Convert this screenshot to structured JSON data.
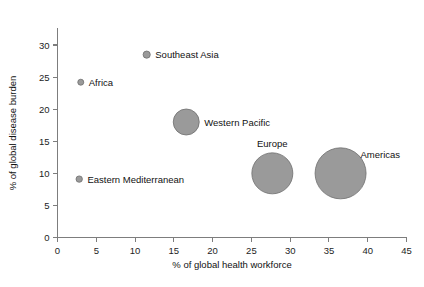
{
  "chart_data": {
    "type": "scatter",
    "title": "",
    "xlabel": "% of global health workforce",
    "ylabel": "% of global disease burden",
    "xlim": [
      0,
      45
    ],
    "ylim": [
      0,
      33
    ],
    "xticks": [
      0,
      5,
      10,
      15,
      20,
      25,
      30,
      35,
      40,
      45
    ],
    "yticks": [
      0,
      5,
      10,
      15,
      20,
      25,
      30
    ],
    "xtick_labels": [
      "0",
      "5",
      "10",
      "15",
      "20",
      "25",
      "30",
      "35",
      "40",
      "45"
    ],
    "ytick_labels": [
      "0",
      "5",
      "10",
      "15",
      "20",
      "25",
      "30"
    ],
    "grid": false,
    "legend": "none",
    "bubble_color": "#9a9a9a",
    "bubble_edge_color": "#6f6f6f",
    "points": [
      {
        "label": "Africa",
        "x": 3.0,
        "y": 24.2,
        "size": 3.0,
        "label_side": "right"
      },
      {
        "label": "Southeast Asia",
        "x": 11.5,
        "y": 28.5,
        "size": 3.6,
        "label_side": "right"
      },
      {
        "label": "Eastern Mediterranean",
        "x": 2.8,
        "y": 9.1,
        "size": 3.2,
        "label_side": "right"
      },
      {
        "label": "Western Pacific",
        "x": 16.6,
        "y": 18.0,
        "size": 13.0,
        "label_side": "right"
      },
      {
        "label": "Europe",
        "x": 27.7,
        "y": 10.0,
        "size": 20.5,
        "label_side": "above"
      },
      {
        "label": "Americas",
        "x": 36.5,
        "y": 10.0,
        "size": 25.5,
        "label_side": "upper-right"
      }
    ]
  }
}
